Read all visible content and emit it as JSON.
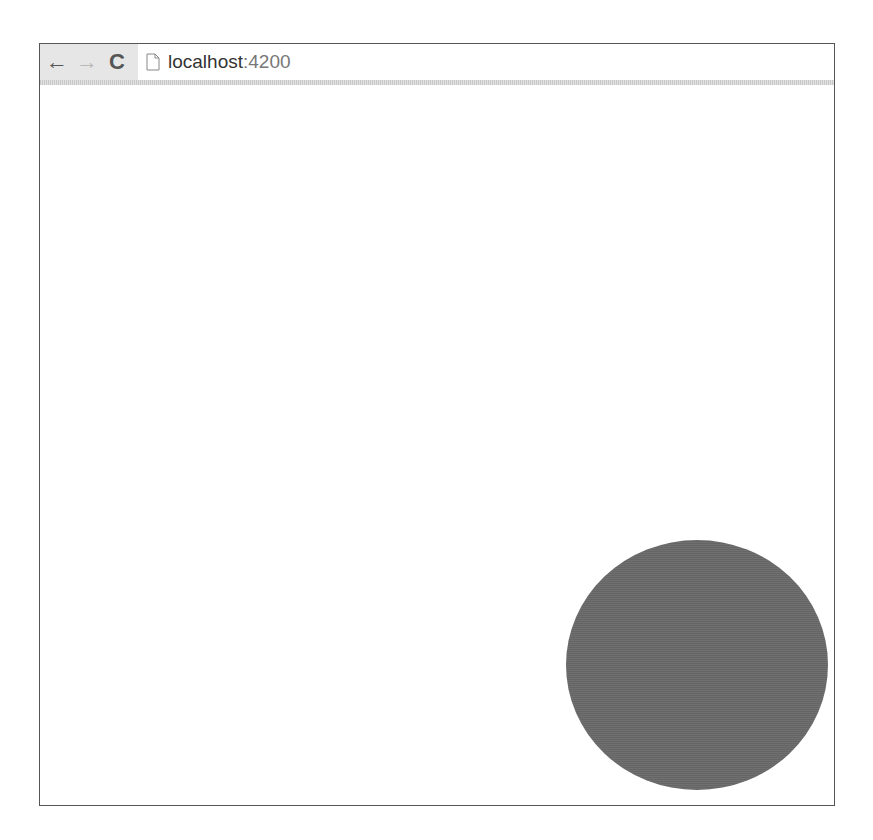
{
  "browser": {
    "nav": {
      "back_icon": "arrow-left-icon",
      "forward_icon": "arrow-right-icon",
      "reload_icon": "reload-icon",
      "back_glyph": "←",
      "forward_glyph": "→",
      "reload_glyph": "C"
    },
    "address_bar": {
      "page_icon": "page-icon",
      "host": "localhost",
      "port": ":4200"
    }
  },
  "page": {
    "shapes": [
      {
        "type": "circle",
        "color": "#6a6a6a"
      }
    ]
  }
}
